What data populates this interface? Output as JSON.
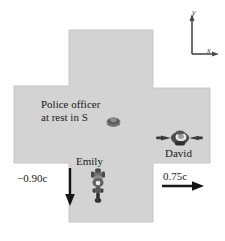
{
  "figure": {
    "colors": {
      "road_fill": "#d3d3d3",
      "road_edge": "#c2c2c2",
      "ink": "#1a1a1a",
      "axis": "#4a4a4a",
      "background": "#ffffff"
    }
  },
  "axes": {
    "y_label": "y",
    "x_label": "x"
  },
  "labels": {
    "police_line1": "Police officer",
    "police_line2": "at rest in S",
    "david": "David",
    "emily": "Emily"
  },
  "velocities": {
    "emily_speed": "−0.90c",
    "david_speed": "0.75c",
    "emily_direction": "down",
    "david_direction": "right"
  },
  "icons": {
    "police_officer": "police-officer-topdown-icon",
    "emily_motorcycle": "motorcycle-topdown-icon",
    "david_motorcycle": "motorcycle-rearview-icon",
    "emily_arrow": "down-arrow-icon",
    "david_arrow": "right-arrow-icon"
  }
}
